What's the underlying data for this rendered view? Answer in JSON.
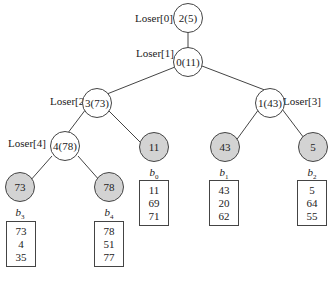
{
  "diagram": {
    "internal_nodes": [
      {
        "id": "loser0",
        "label": "Loser[0]",
        "value": "2(5)"
      },
      {
        "id": "loser1",
        "label": "Loser[1]",
        "value": "0(11)"
      },
      {
        "id": "loser2",
        "label": "Loser[2]",
        "value": "3(73)"
      },
      {
        "id": "loser3",
        "label": "Loser[3]",
        "value": "1(43)"
      },
      {
        "id": "loser4",
        "label": "Loser[4]",
        "value": "4(78)"
      }
    ],
    "leaves": [
      {
        "id": "b3",
        "value": "73",
        "buffer_name": "b",
        "buffer_index": "3",
        "buffer": [
          "73",
          "4",
          "35"
        ]
      },
      {
        "id": "b4",
        "value": "78",
        "buffer_name": "b",
        "buffer_index": "4",
        "buffer": [
          "78",
          "51",
          "77"
        ]
      },
      {
        "id": "b0",
        "value": "11",
        "buffer_name": "b",
        "buffer_index": "0",
        "buffer": [
          "11",
          "69",
          "71"
        ]
      },
      {
        "id": "b1",
        "value": "43",
        "buffer_name": "b",
        "buffer_index": "1",
        "buffer": [
          "43",
          "20",
          "62"
        ]
      },
      {
        "id": "b2",
        "value": "5",
        "buffer_name": "b",
        "buffer_index": "2",
        "buffer": [
          "5",
          "64",
          "55"
        ]
      }
    ],
    "edges": [
      [
        "loser0",
        "loser1"
      ],
      [
        "loser1",
        "loser2"
      ],
      [
        "loser1",
        "loser3"
      ],
      [
        "loser2",
        "loser4"
      ],
      [
        "loser2",
        "b0"
      ],
      [
        "loser3",
        "b1"
      ],
      [
        "loser3",
        "b2"
      ],
      [
        "loser4",
        "b3"
      ],
      [
        "loser4",
        "b4"
      ]
    ],
    "colors": {
      "leaf_fill": "#d3d3d3",
      "node_fill": "#ffffff",
      "stroke": "#444444"
    }
  }
}
